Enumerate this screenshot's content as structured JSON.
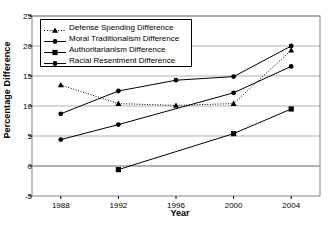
{
  "chart_data": {
    "type": "line",
    "title": "",
    "xlabel": "Year",
    "ylabel": "Percentage Difference",
    "categories": [
      "1988",
      "1992",
      "1996",
      "2000",
      "2004"
    ],
    "x": [
      1988,
      1992,
      1996,
      2000,
      2004
    ],
    "ylim": [
      -5,
      25
    ],
    "yticks": [
      25,
      20,
      15,
      10,
      5,
      0,
      -5
    ],
    "xlim": [
      1986,
      2006
    ],
    "grid": "horizontal",
    "legend_position": "upper-left-inside",
    "series": [
      {
        "name": "Defense Spending Difference",
        "marker": "triangle",
        "linestyle": "dotted",
        "color": "#000000",
        "values": [
          13.5,
          10.4,
          10.1,
          10.4,
          19.3
        ]
      },
      {
        "name": "Moral Traditionalism Difference",
        "marker": "circle",
        "linestyle": "solid",
        "color": "#000000",
        "values": [
          4.4,
          6.9,
          null,
          12.2,
          16.6
        ]
      },
      {
        "name": "Authoritarianism Difference",
        "marker": "square",
        "linestyle": "solid",
        "color": "#000000",
        "values": [
          null,
          -0.6,
          null,
          5.4,
          9.5
        ]
      },
      {
        "name": "Racial Resentment Difference",
        "marker": "circle",
        "linestyle": "solid",
        "color": "#000000",
        "values": [
          8.7,
          12.5,
          14.3,
          14.9,
          20.0
        ]
      }
    ]
  },
  "axis": {
    "ylabel": "Percentage Difference",
    "xlabel": "Year",
    "ytick_labels": [
      "25",
      "20",
      "15",
      "10",
      "5",
      "0",
      "-5"
    ],
    "xtick_labels": [
      "1988",
      "1992",
      "1996",
      "2000",
      "2004"
    ]
  },
  "legend": {
    "entries": [
      {
        "label": "Defense Spending Difference"
      },
      {
        "label": "Moral Traditionalism Difference"
      },
      {
        "label": "Authoritarianism Difference"
      },
      {
        "label": "Racial Resentment Difference"
      }
    ]
  },
  "colors": {
    "line": "#000000",
    "grid": "#b0b0b0",
    "frame": "#808080",
    "background": "#ffffff"
  }
}
